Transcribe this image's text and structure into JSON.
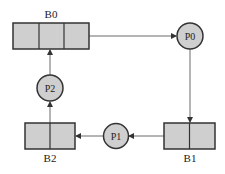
{
  "diagram": {
    "colors": {
      "fill": "#cfcfcf",
      "stroke": "#333333",
      "edge": "#444444"
    },
    "buffers": [
      {
        "id": "B0",
        "label": "B0",
        "slots": 3
      },
      {
        "id": "B1",
        "label": "B1",
        "slots": 2
      },
      {
        "id": "B2",
        "label": "B2",
        "slots": 2
      }
    ],
    "processes": [
      {
        "id": "P0",
        "label": "P0"
      },
      {
        "id": "P1",
        "label": "P1"
      },
      {
        "id": "P2",
        "label": "P2"
      }
    ],
    "edges": [
      {
        "from": "B0",
        "to": "P0"
      },
      {
        "from": "P0",
        "to": "B1"
      },
      {
        "from": "B1",
        "to": "P1"
      },
      {
        "from": "P1",
        "to": "B2"
      },
      {
        "from": "B2",
        "to": "P2"
      },
      {
        "from": "P2",
        "to": "B0"
      }
    ]
  }
}
